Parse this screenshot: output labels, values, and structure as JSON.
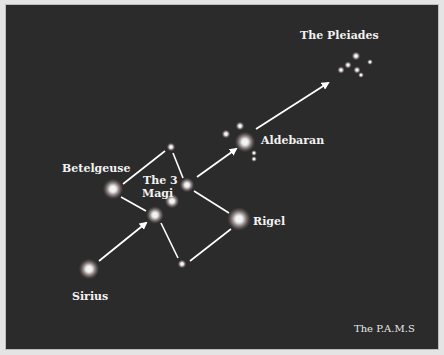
{
  "diagram": {
    "background": "#2b2b2b",
    "line_color": "#ffffff",
    "labels": {
      "pleiades": "The Pleiades",
      "aldebaran": "Aldebaran",
      "betelgeuse": "Betelgeuse",
      "magi_line1": "The 3",
      "magi_line2": "Magi",
      "rigel": "Rigel",
      "sirius": "Sirius",
      "credit": "The P.A.M.S"
    },
    "stars": [
      {
        "name": "Sirius",
        "x": 88,
        "y": 268,
        "r": 7
      },
      {
        "name": "Betelgeuse",
        "x": 112,
        "y": 188,
        "r": 7
      },
      {
        "name": "Top small star",
        "x": 170,
        "y": 146,
        "r": 3
      },
      {
        "name": "Magi left",
        "x": 154,
        "y": 214,
        "r": 6
      },
      {
        "name": "Magi middle",
        "x": 171,
        "y": 200,
        "r": 5
      },
      {
        "name": "Magi right",
        "x": 186,
        "y": 184,
        "r": 5
      },
      {
        "name": "Rigel",
        "x": 238,
        "y": 218,
        "r": 8
      },
      {
        "name": "Bottom small star",
        "x": 181,
        "y": 263,
        "r": 3
      },
      {
        "name": "Aldebaran",
        "x": 244,
        "y": 141,
        "r": 7
      },
      {
        "name": "Hyades 1",
        "x": 239,
        "y": 125,
        "r": 3
      },
      {
        "name": "Hyades 2",
        "x": 225,
        "y": 133,
        "r": 3
      },
      {
        "name": "Hyades 3",
        "x": 253,
        "y": 152,
        "r": 2
      },
      {
        "name": "Hyades 4",
        "x": 253,
        "y": 158,
        "r": 2
      },
      {
        "name": "Pleiades 1",
        "x": 355,
        "y": 55,
        "r": 3
      },
      {
        "name": "Pleiades 2",
        "x": 347,
        "y": 64,
        "r": 2.5
      },
      {
        "name": "Pleiades 3",
        "x": 356,
        "y": 69,
        "r": 2.5
      },
      {
        "name": "Pleiades 4",
        "x": 340,
        "y": 69,
        "r": 2.5
      },
      {
        "name": "Pleiades 5",
        "x": 369,
        "y": 61,
        "r": 2
      },
      {
        "name": "Pleiades 6",
        "x": 360,
        "y": 74,
        "r": 2
      }
    ],
    "lines": [
      {
        "from": [
          122,
          183
        ],
        "to": [
          164,
          150
        ]
      },
      {
        "from": [
          172,
          152
        ],
        "to": [
          182,
          177
        ]
      },
      {
        "from": [
          120,
          196
        ],
        "to": [
          145,
          210
        ]
      },
      {
        "from": [
          160,
          222
        ],
        "to": [
          177,
          257
        ]
      },
      {
        "from": [
          193,
          190
        ],
        "to": [
          228,
          212
        ]
      },
      {
        "from": [
          189,
          260
        ],
        "to": [
          230,
          228
        ]
      }
    ],
    "arrows": [
      {
        "from": [
          98,
          260
        ],
        "to": [
          145,
          222
        ]
      },
      {
        "from": [
          196,
          176
        ],
        "to": [
          235,
          148
        ]
      },
      {
        "from": [
          255,
          128
        ],
        "to": [
          327,
          82
        ]
      }
    ]
  }
}
